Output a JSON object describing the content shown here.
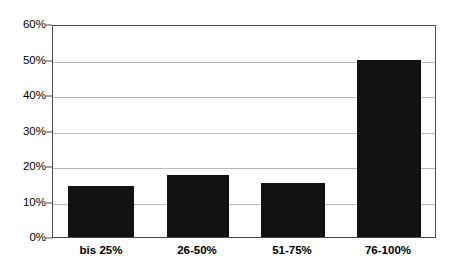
{
  "chart_data": {
    "type": "bar",
    "title": "",
    "subtitle": "",
    "xlabel": "",
    "ylabel": "",
    "categories": [
      "bis 25%",
      "26-50%",
      "51-75%",
      "76-100%"
    ],
    "values": [
      14.5,
      17.5,
      15.5,
      50.3
    ],
    "value_labels": [
      "",
      "",
      "",
      ""
    ],
    "ylim": [
      0,
      60
    ],
    "ytick_labels": [
      "0%",
      "10%",
      "20%",
      "30%",
      "40%",
      "50%",
      "60%"
    ],
    "ytick_values": [
      0,
      10,
      20,
      30,
      40,
      50,
      60
    ],
    "grid": true,
    "legend": null,
    "legend_position": "none",
    "annotations": [],
    "colors": {
      "bar": "#121212",
      "gridline": "#b9b9b9",
      "frame": "#4a4a4a",
      "background": "#ffffff",
      "text": "#000000"
    }
  }
}
